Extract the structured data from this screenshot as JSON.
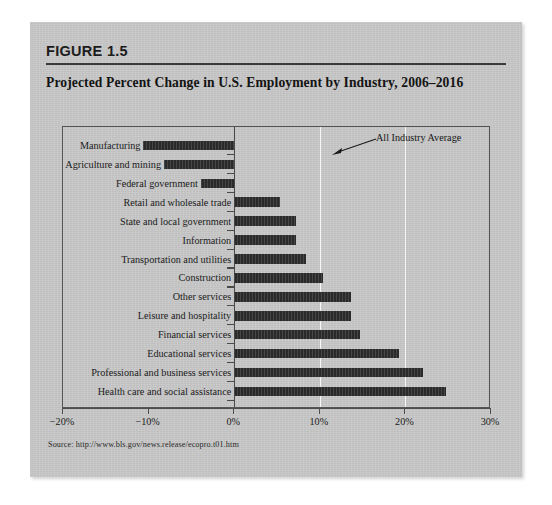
{
  "figure": {
    "number_label": "FIGURE 1.5",
    "title": "Projected Percent Change in U.S. Employment by Industry, 2006–2016",
    "source": "Source: http://www.bls.gov/news.release/ecopro.t01.htm",
    "annotation": "All Industry Average"
  },
  "chart_data": {
    "type": "bar",
    "orientation": "horizontal",
    "title": "Projected Percent Change in U.S. Employment by Industry, 2006–2016",
    "xlabel": "",
    "ylabel": "",
    "xlim": [
      -20,
      30
    ],
    "xticks": [
      -20,
      -10,
      0,
      10,
      20,
      30
    ],
    "xtick_labels": [
      "−20%",
      "−10%",
      "0%",
      "10%",
      "20%",
      "30%"
    ],
    "grid": "vertical-light-at-10-and-20",
    "legend": "none",
    "bar_color": "#2a2a2a",
    "annotations": [
      {
        "text": "All Industry Average",
        "points_to_x": 10
      }
    ],
    "categories": [
      "Manufacturing",
      "Agriculture and mining",
      "Federal government",
      "Retail and wholesale trade",
      "State and local government",
      "Information",
      "Transportation and utilities",
      "Construction",
      "Other services",
      "Leisure and hospitality",
      "Financial services",
      "Educational services",
      "Professional and business services",
      "Health care and social assistance"
    ],
    "values": [
      -10.6,
      -8.2,
      -3.9,
      5.4,
      7.2,
      7.2,
      8.4,
      10.4,
      13.6,
      13.6,
      14.7,
      19.2,
      22.0,
      24.7
    ]
  }
}
